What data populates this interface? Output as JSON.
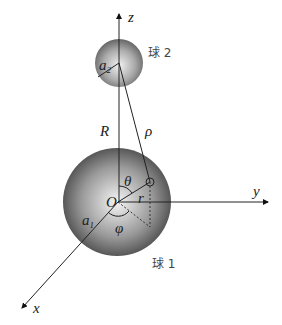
{
  "labels": {
    "z_axis": "z",
    "y_axis": "y",
    "x_axis": "x",
    "sphere2": "球 2",
    "sphere1": "球 1",
    "a2": "a",
    "a2_sub": "2",
    "a1": "a",
    "a1_sub": "1",
    "R": "R",
    "rho": "ρ",
    "theta": "θ",
    "origin": "O",
    "r": "r",
    "phi": "φ"
  }
}
